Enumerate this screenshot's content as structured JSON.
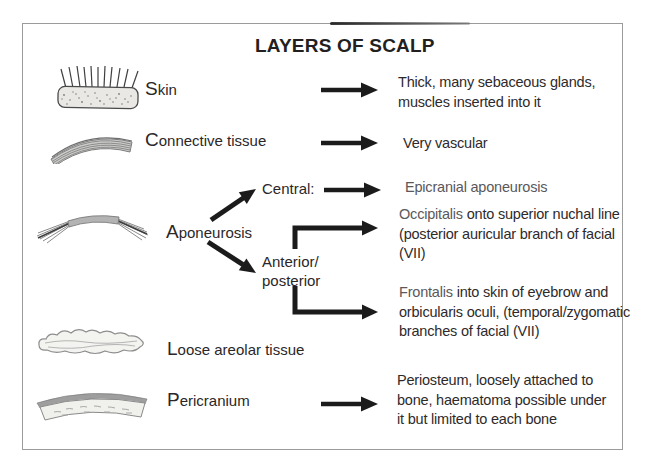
{
  "title": "LAYERS OF SCALP",
  "layers": {
    "skin": {
      "label": "Skin",
      "description": "Thick, many sebaceous glands, muscles inserted into it"
    },
    "connective": {
      "label": "Connective tissue",
      "description": "Very vascular"
    },
    "aponeurosis": {
      "label": "Aponeurosis",
      "central_label": "Central:",
      "central_description": "Epicranial aponeurosis",
      "branch_label_line1": "Anterior/",
      "branch_label_line2": "posterior",
      "occipitalis_term": "Occipitalis",
      "occipitalis_description": " onto superior nuchal line (posterior auricular branch of facial (VII)",
      "frontalis_term": "Frontalis",
      "frontalis_description": " into skin of eyebrow and orbicularis oculi, (temporal/zygomatic branches of facial (VII)"
    },
    "loose_areolar": {
      "label": "Loose areolar tissue"
    },
    "pericranium": {
      "label": "Pericranium",
      "description": "Periosteum, loosely attached to bone, haematoma possible under it but limited to each bone"
    }
  },
  "colors": {
    "text_dark": "#2b2728",
    "term_gray": "#5a585b",
    "arrow_black": "#1b1b1b",
    "frame_border": "#9b9b9b",
    "illustration_fill": "#e9e8e4",
    "illustration_stroke": "#7a7a7a"
  }
}
